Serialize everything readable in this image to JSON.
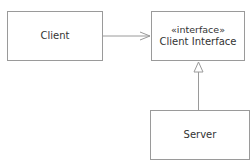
{
  "diagram": {
    "type": "UML class diagram",
    "nodes": [
      {
        "id": "client",
        "label": "Client"
      },
      {
        "id": "client_interface",
        "stereotype": "«interface»",
        "label": "Client Interface"
      },
      {
        "id": "server",
        "label": "Server"
      }
    ],
    "edges": [
      {
        "from": "client",
        "to": "client_interface",
        "kind": "dependency/association",
        "arrow": "open"
      },
      {
        "from": "server",
        "to": "client_interface",
        "kind": "realization",
        "arrow": "hollow-triangle"
      }
    ],
    "colors": {
      "line": "#9a9a9a",
      "text": "#333333",
      "background": "#ffffff"
    }
  }
}
